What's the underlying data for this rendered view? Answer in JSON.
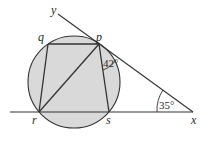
{
  "diagram": {
    "points": {
      "p": "p",
      "q": "q",
      "r": "r",
      "s": "s",
      "x": "x",
      "y": "y"
    },
    "angles": {
      "angle_at_p": "42°",
      "angle_at_x": "35°"
    },
    "colors": {
      "circle_fill": "#d9d9d9",
      "stroke": "#333333",
      "background": "#ffffff"
    }
  }
}
